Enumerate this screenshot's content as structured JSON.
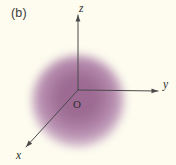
{
  "figure": {
    "panel_label": "(b)",
    "background_color": "#fdfcef",
    "axis_color": "#4a4a4a",
    "label_color": "#2e2e2e"
  },
  "axes": {
    "origin_label": "O",
    "x_label": "x",
    "y_label": "y",
    "z_label": "z",
    "origin": {
      "x": 78,
      "y": 90
    },
    "x_tip": {
      "x": 26,
      "y": 147
    },
    "y_tip": {
      "x": 158,
      "y": 91
    },
    "z_tip": {
      "x": 78,
      "y": 15
    }
  },
  "electron_cloud": {
    "shape": "sphere",
    "center_x": 78,
    "center_y": 101,
    "radius": 46,
    "core_color": "#9c6a93",
    "mid_color": "#b489ab",
    "edge_color": "#e8d9e5",
    "description": "diffuse spherical electron density cloud"
  }
}
